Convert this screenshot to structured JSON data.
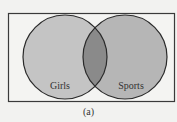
{
  "diagram": {
    "type": "venn",
    "sets": [
      {
        "label": "Girls",
        "fill": "#c4c4c4"
      },
      {
        "label": "Sports",
        "fill": "#b6b6b6"
      }
    ],
    "intersection_fill": "#8a8a8a",
    "caption": "(a)"
  }
}
